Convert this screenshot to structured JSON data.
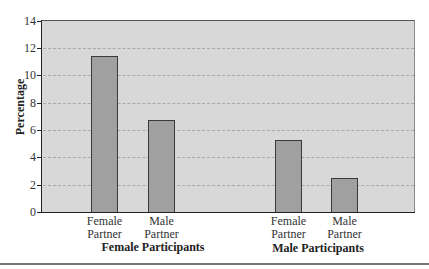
{
  "chart_data": {
    "type": "bar",
    "title": "",
    "xlabel": "",
    "ylabel": "Percentage",
    "ylim": [
      0,
      14
    ],
    "yticks": [
      0,
      2,
      4,
      6,
      8,
      10,
      12,
      14
    ],
    "grid": true,
    "legend": null,
    "groups": [
      {
        "name": "Female Participants",
        "categories": [
          "Female Partner",
          "Male Partner"
        ],
        "values": [
          11.4,
          6.7
        ]
      },
      {
        "name": "Male Participants",
        "categories": [
          "Female Partner",
          "Male Partner"
        ],
        "values": [
          5.3,
          2.5
        ]
      }
    ],
    "categories": [
      "Female Partner",
      "Male Partner",
      "Female Partner",
      "Male Partner"
    ],
    "values": [
      11.4,
      6.7,
      5.3,
      2.5
    ],
    "colors": {
      "bar_fill": "#a0a0a0",
      "bar_border": "#3a3a3a",
      "plot_bg": "#d8d8d8",
      "grid": "#a8a8a8"
    }
  },
  "labels": {
    "y_title": "Percentage",
    "ticks": [
      "0",
      "2",
      "4",
      "6",
      "8",
      "10",
      "12",
      "14"
    ],
    "bars": [
      {
        "line1": "Female",
        "line2": "Partner"
      },
      {
        "line1": "Male",
        "line2": "Partner"
      },
      {
        "line1": "Female",
        "line2": "Partner"
      },
      {
        "line1": "Male",
        "line2": "Partner"
      }
    ],
    "groups": [
      "Female Participants",
      "Male Participants"
    ]
  }
}
